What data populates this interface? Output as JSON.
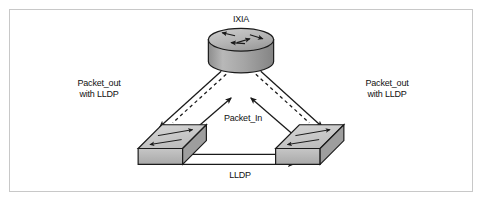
{
  "figure": {
    "kind": "network-topology-diagram",
    "background_color": "#ffffff",
    "border_color": "#c8c8c8"
  },
  "nodes": [
    {
      "id": "ixia",
      "label": "IXIA",
      "icon": "router-icon",
      "shape": "cylinder",
      "fill_color": "#b0b0b0",
      "stroke_color": "#1a1a1a"
    },
    {
      "id": "switch-left",
      "label": "",
      "icon": "switch-icon",
      "shape": "isometric-box",
      "fill_color": "#c9c9c9",
      "stroke_color": "#1a1a1a"
    },
    {
      "id": "switch-right",
      "label": "",
      "icon": "switch-icon",
      "shape": "isometric-box",
      "fill_color": "#c9c9c9",
      "stroke_color": "#1a1a1a"
    }
  ],
  "edges": [
    {
      "id": "packet-out-left",
      "label": "Packet_out\nwith LLDP",
      "label_line1": "Packet_out",
      "label_line2": "with LLDP",
      "style": "solid-and-dashed",
      "direction": "ixia-to-switch-left",
      "arrowhead": "down-left"
    },
    {
      "id": "packet-out-right",
      "label": "Packet_out\nwith LLDP",
      "label_line1": "Packet_out",
      "label_line2": "with LLDP",
      "style": "solid-and-dashed",
      "direction": "ixia-to-switch-right",
      "arrowhead": "down-right"
    },
    {
      "id": "packet-in",
      "label": "Packet_In",
      "style": "solid",
      "direction": "switches-to-ixia",
      "arrowhead": "up"
    },
    {
      "id": "lldp-link",
      "label": "LLDP",
      "style": "solid",
      "direction": "switch-left-to-switch-right",
      "arrowhead": "right"
    }
  ],
  "labels": {
    "ixia": "IXIA",
    "packet_out_left_line1": "Packet_out",
    "packet_out_left_line2": "with LLDP",
    "packet_out_right_line1": "Packet_out",
    "packet_out_right_line2": "with LLDP",
    "packet_in": "Packet_In",
    "lldp": "LLDP"
  }
}
